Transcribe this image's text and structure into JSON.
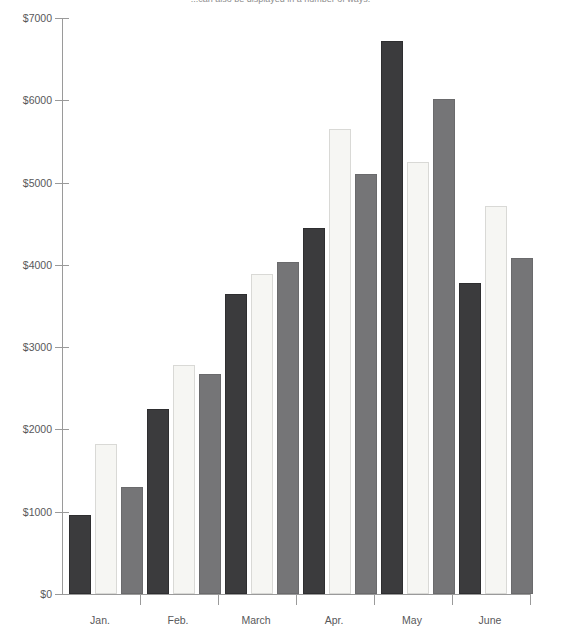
{
  "caption": "...can also be displayed in a number of ways.",
  "chart_data": {
    "type": "bar",
    "title": "",
    "subtitle": "",
    "xlabel": "",
    "ylabel": "",
    "categories": [
      "Jan.",
      "Feb.",
      "March",
      "Apr.",
      "May",
      "June"
    ],
    "series": [
      {
        "name": "series-1-dark",
        "color": "#3b3b3d",
        "values": [
          960,
          2250,
          3640,
          4450,
          6720,
          3780
        ]
      },
      {
        "name": "series-2-light",
        "color": "#f6f6f3",
        "values": [
          1820,
          2780,
          3890,
          5650,
          5250,
          4720
        ]
      },
      {
        "name": "series-3-mid",
        "color": "#757577",
        "values": [
          1300,
          2670,
          4040,
          5100,
          6020,
          4080
        ]
      }
    ],
    "ylim": [
      0,
      7000
    ],
    "ytick_values": [
      0,
      1000,
      2000,
      3000,
      4000,
      5000,
      6000,
      7000
    ],
    "ytick_labels": [
      "$0",
      "$1000",
      "$2000",
      "$3000",
      "$4000",
      "$5000",
      "$6000",
      "$7000"
    ],
    "grid": false,
    "legend": "none",
    "currency_symbol": "$"
  },
  "axis": {
    "y_label_0": "$0",
    "y_label_1": "$1000",
    "y_label_2": "$2000",
    "y_label_3": "$3000",
    "y_label_4": "$4000",
    "y_label_5": "$5000",
    "y_label_6": "$6000",
    "y_label_7": "$7000"
  },
  "colors": {
    "axis": "#9a9a9a",
    "text": "#58585a",
    "background": "#ffffff",
    "series_dark": "#3b3b3d",
    "series_light": "#f6f6f3",
    "series_mid": "#757577"
  }
}
